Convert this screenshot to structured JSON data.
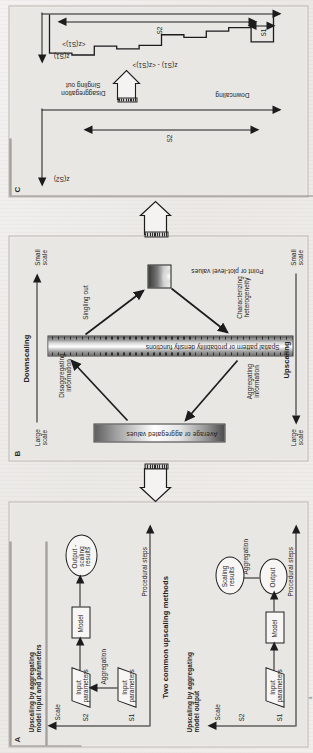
{
  "figure": {
    "caption_number": "FIGURE 1",
    "orientation": "rotated-90-ccw",
    "panels": [
      "A",
      "B",
      "C"
    ]
  },
  "panel_a": {
    "letter": "A",
    "center_title": "Two common upscaling methods",
    "top_block": {
      "title": "Upscaling by aggregating\nmodel input and parameters",
      "axis_label": "Scale",
      "scale_upper": "S2",
      "scale_lower": "S1",
      "steps_label": "Procedural steps",
      "node_input_params_upper": "Input\nparameters",
      "node_input_params_lower": "Input\nparameters",
      "edge_aggregation": "Aggregation",
      "node_model": "Model",
      "node_output": "Output -\nscaling\nresults"
    },
    "bottom_block": {
      "title": "Upscaling by aggregating\nmodel output",
      "axis_label": "Scale",
      "scale_upper": "S2",
      "scale_lower": "S1",
      "steps_label": "Procedural steps",
      "node_input_params": "Input\nparameters",
      "node_model": "Model",
      "node_output": "Output",
      "edge_aggregation": "Aggregation",
      "node_scaling_results": "Scaling\nresults"
    }
  },
  "panel_b": {
    "letter": "B",
    "top_axis_label": "Downscaling",
    "top_axis_left": "Large\nscale",
    "top_axis_right": "Small\nscale",
    "bottom_axis_label": "Upscaling",
    "bottom_axis_left": "Large\nscale",
    "bottom_axis_right": "Small\nscale",
    "node_left": "Average or aggregated values",
    "node_center": "Spatial pattern or probability density functions",
    "node_right": "Point or plot-level values",
    "edge_disaggregating": "Disaggregating\ninformation",
    "edge_aggregating": "Aggregating\ninformation",
    "edge_singling_out": "Singling out",
    "edge_characterizing": "Characterizing\nheterogeneity"
  },
  "panel_c": {
    "letter": "C",
    "left_axis_label": "z(S2)",
    "left_extent_label": "S2",
    "arrow_down_label": "Downcaling",
    "arrow_right_label": "Disaggregation\nSingling out",
    "right_axis_label": "z(S1)",
    "right_mean_label": "<z(S1)>",
    "right_series_label": "z(S1) - <z(S1)>",
    "right_extent_label": "S2",
    "right_small_extent_label": "S1",
    "profile_steps": [
      0.62,
      0.3,
      0.38,
      0.52,
      0.46,
      0.7,
      0.78,
      0.72,
      0.92,
      0.88
    ]
  },
  "interconnect": {
    "arrow_a_to_b": "upscaling-block-arrow",
    "arrow_b_to_c": "downscaling-block-arrow"
  },
  "bleed_text": {
    "col": "the scale of measurement and the scale of the\nprocess of interest may differ by orders of\nmagnitude.  Information obtained at one scale\nmust therefore be transferred to another, and\nthe methods used for that transfer depend on\nwhether the target scale is larger or smaller\nthan the scale of observation."
  }
}
